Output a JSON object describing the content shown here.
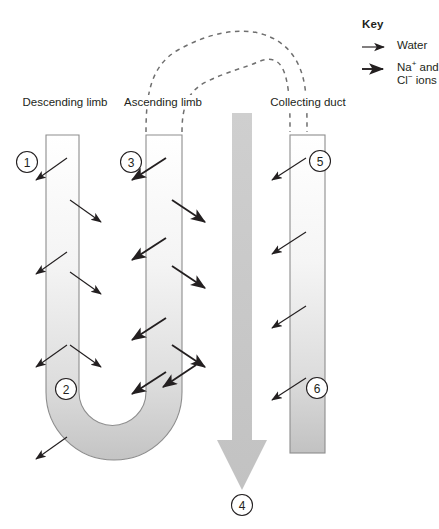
{
  "diagram": {
    "labels": {
      "descending_limb": "Descending limb",
      "ascending_limb": "Ascending limb",
      "collecting_duct": "Collecting duct"
    },
    "markers": [
      {
        "id": "1",
        "label": "1",
        "x": 27,
        "y": 162
      },
      {
        "id": "2",
        "label": "2",
        "x": 66,
        "y": 389
      },
      {
        "id": "3",
        "label": "3",
        "x": 131,
        "y": 162
      },
      {
        "id": "4",
        "label": "4",
        "x": 242,
        "y": 505
      },
      {
        "id": "5",
        "label": "5",
        "x": 320,
        "y": 161
      },
      {
        "id": "6",
        "label": "6",
        "x": 317,
        "y": 388
      }
    ],
    "colors": {
      "tube_outline": "#8d8d8d",
      "tube_fill_top": "#ffffff",
      "tube_fill_bottom": "#c9c9c9",
      "arrow_dark": "#231f20",
      "gradient_arrow": "#c6c6c6",
      "dashed_line": "#6f6f6f",
      "text": "#231f20"
    }
  },
  "key": {
    "title": "Key",
    "items": [
      {
        "icon": "thin-arrow-icon",
        "label": "Water",
        "weight": "thin"
      },
      {
        "icon": "thick-arrow-icon",
        "label": "Na+ and Cl- ions",
        "weight": "thick",
        "line1_prefix": "Na",
        "line1_sup": "+",
        "line1_suffix": " and",
        "line2_prefix": "Cl",
        "line2_sup": "−",
        "line2_suffix": " ions"
      }
    ]
  }
}
